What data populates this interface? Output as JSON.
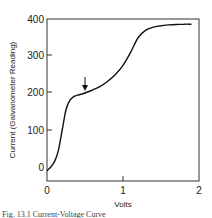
{
  "chart_data": {
    "type": "line",
    "title": "",
    "xlabel": "Volts",
    "ylabel": "Current (Galvanometer Reading)",
    "xlim": [
      0,
      2
    ],
    "ylim": [
      -10,
      400
    ],
    "x_ticks": [
      "0",
      "1",
      "2"
    ],
    "y_ticks": [
      "0",
      "100",
      "200",
      "300",
      "400"
    ],
    "grid": false,
    "legend": null,
    "series": [
      {
        "name": "current-voltage curve",
        "x": [
          0.0,
          0.05,
          0.1,
          0.15,
          0.2,
          0.25,
          0.3,
          0.35,
          0.4,
          0.5,
          0.6,
          0.7,
          0.8,
          0.9,
          1.0,
          1.1,
          1.2,
          1.3,
          1.4,
          1.5,
          1.6,
          1.7,
          1.8,
          1.9
        ],
        "y": [
          -10,
          0,
          15,
          45,
          100,
          155,
          180,
          190,
          194,
          200,
          208,
          218,
          232,
          250,
          275,
          310,
          350,
          370,
          378,
          382,
          384,
          385,
          386,
          386
        ]
      }
    ],
    "annotations": [
      {
        "type": "arrow",
        "x": 0.5,
        "y": 200,
        "direction": "down"
      }
    ]
  },
  "caption": {
    "text": "Fig. 13.1 Current-Voltage Curve"
  }
}
